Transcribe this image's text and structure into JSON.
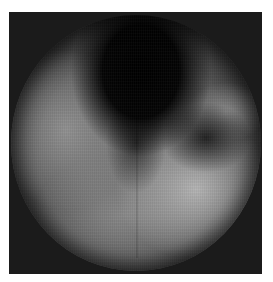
{
  "image": {
    "kind": "grayscale endoscopic circular view",
    "background_color": "#ffffff",
    "frame_color": "#1b1b1b",
    "regions": [
      {
        "name": "dark-lumen",
        "description": "dark region top-center",
        "color": "#000000"
      },
      {
        "name": "right-lobe",
        "description": "bright lobe at right",
        "color": "#969696"
      },
      {
        "name": "lower-bright-area",
        "description": "bright lower-right area",
        "color": "#b9b9b9"
      },
      {
        "name": "left-wall",
        "description": "mid-gray left wall",
        "color": "#969696"
      }
    ]
  }
}
